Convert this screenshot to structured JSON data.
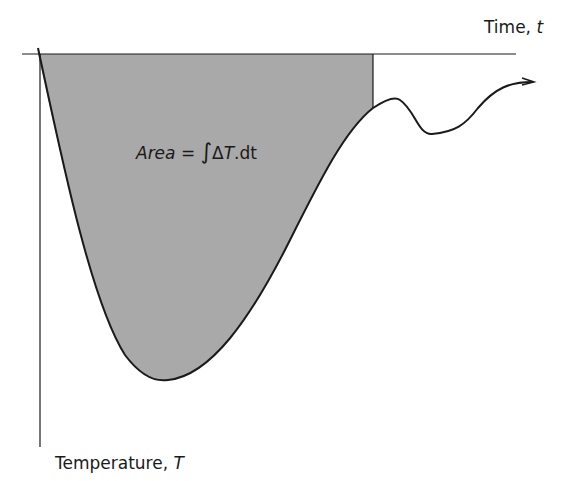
{
  "diagram": {
    "type": "temperature-time curve with shaded area",
    "x_axis": {
      "label_text": "Time, ",
      "label_var": "t"
    },
    "y_axis": {
      "label_text": "Temperature, ",
      "label_var": "T"
    },
    "annotation": {
      "lhs": "Area",
      "eq": " = ",
      "integral": "∫",
      "delta": "Δ",
      "var": "T",
      "rest": ".dt"
    },
    "colors": {
      "line": "#1a1a1a",
      "shade": "#a9a9a9",
      "background": "#ffffff"
    }
  }
}
